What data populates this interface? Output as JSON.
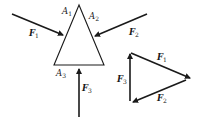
{
  "diagram": {
    "colors": {
      "stroke": "#1a1a1a",
      "background": "#ffffff"
    },
    "body_triangle": {
      "vertices": {
        "A1": {
          "label": "A",
          "sub": "1"
        },
        "A2": {
          "label": "A",
          "sub": "2"
        },
        "A3": {
          "label": "A",
          "sub": "3"
        }
      }
    },
    "forces": {
      "F1": {
        "label": "F",
        "sub": "1"
      },
      "F2": {
        "label": "F",
        "sub": "2"
      },
      "F3": {
        "label": "F",
        "sub": "3"
      }
    },
    "force_triangle": {
      "F1": {
        "label": "F",
        "sub": "1"
      },
      "F2": {
        "label": "F",
        "sub": "2"
      },
      "F3": {
        "label": "F",
        "sub": "3"
      }
    }
  }
}
